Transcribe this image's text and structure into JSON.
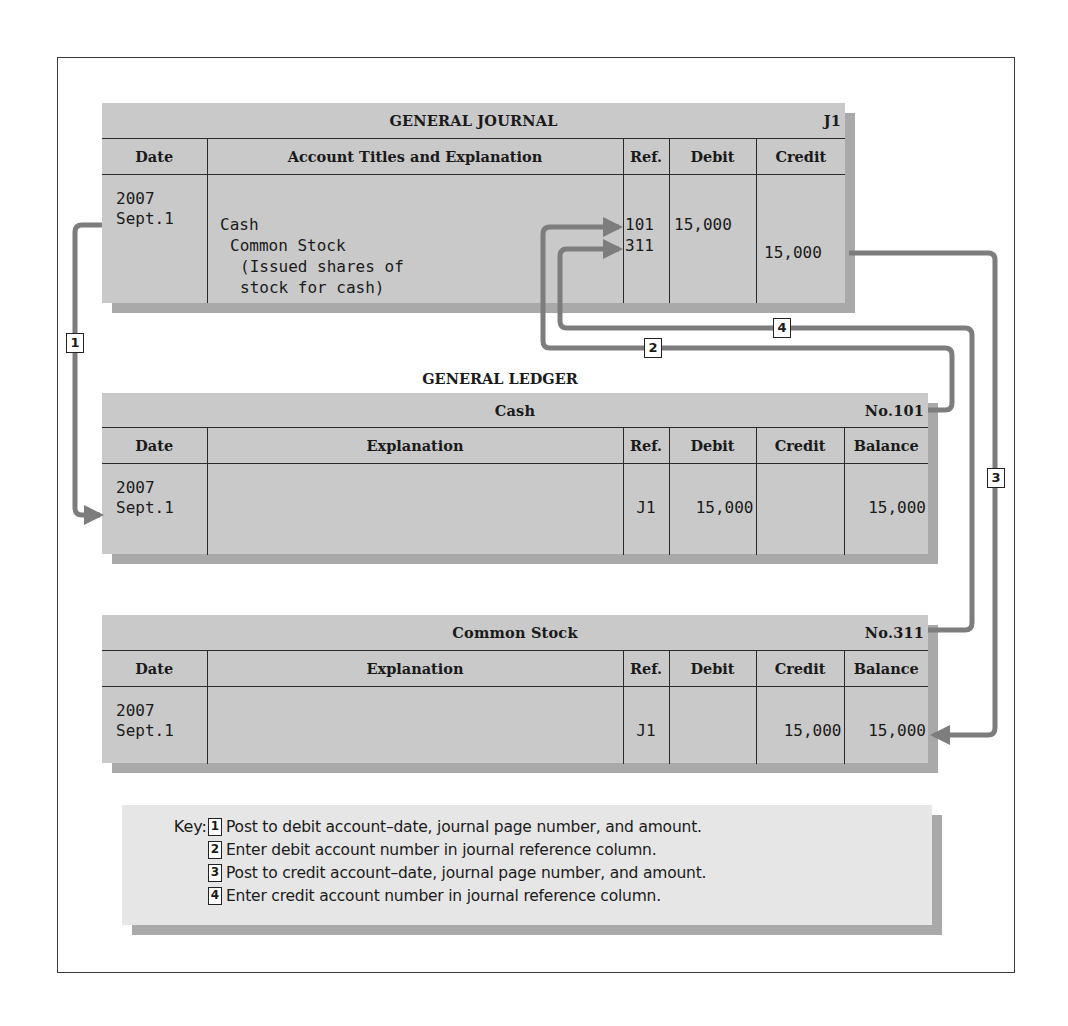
{
  "journal": {
    "title": "GENERAL JOURNAL",
    "page": "J1",
    "columns": [
      "Date",
      "Account Titles and Explanation",
      "Ref.",
      "Debit",
      "Credit"
    ],
    "entry": {
      "year": "2007",
      "date": "Sept.1",
      "lines": [
        {
          "text": "Cash",
          "ref": "101",
          "debit": "15,000",
          "credit": ""
        },
        {
          "text": "Common Stock",
          "ref": "311",
          "debit": "",
          "credit": "15,000"
        },
        {
          "text": "(Issued shares of",
          "ref": "",
          "debit": "",
          "credit": ""
        },
        {
          "text": "stock for cash)",
          "ref": "",
          "debit": "",
          "credit": ""
        }
      ]
    }
  },
  "ledger": {
    "title": "GENERAL LEDGER",
    "columns": [
      "Date",
      "Explanation",
      "Ref.",
      "Debit",
      "Credit",
      "Balance"
    ],
    "accounts": [
      {
        "name": "Cash",
        "number": "No.101",
        "rows": [
          {
            "year": "2007",
            "date": "Sept.1",
            "explanation": "",
            "ref": "J1",
            "debit": "15,000",
            "credit": "",
            "balance": "15,000"
          }
        ]
      },
      {
        "name": "Common Stock",
        "number": "No.311",
        "rows": [
          {
            "year": "2007",
            "date": "Sept.1",
            "explanation": "",
            "ref": "J1",
            "debit": "",
            "credit": "15,000",
            "balance": "15,000"
          }
        ]
      }
    ]
  },
  "steps": {
    "labels": [
      "1",
      "2",
      "3",
      "4"
    ]
  },
  "key": {
    "label": "Key:",
    "items": [
      {
        "num": "1",
        "text": "Post to debit account–date, journal page number, and amount."
      },
      {
        "num": "2",
        "text": "Enter debit account number in journal reference column."
      },
      {
        "num": "3",
        "text": "Post to credit account–date, journal page number, and amount."
      },
      {
        "num": "4",
        "text": "Enter credit account number in journal reference column."
      }
    ]
  },
  "colors": {
    "panel": "#c9c9c9",
    "panel_shadow": "#a9a9a9",
    "arrow": "#7d7d7d",
    "key_bg": "#e6e6e6",
    "rule": "#2a2a2a"
  }
}
